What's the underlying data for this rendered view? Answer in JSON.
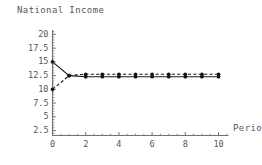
{
  "chart_data": {
    "type": "line",
    "title": "National Income",
    "xlabel": "Period",
    "ylabel": "",
    "xlim": [
      0,
      10.6
    ],
    "ylim": [
      1.6,
      20.8
    ],
    "grid": false,
    "legend": "none",
    "x": [
      0,
      1,
      2,
      3,
      4,
      5,
      6,
      7,
      8,
      9,
      10
    ],
    "series": [
      {
        "name": "series-dashed-upper",
        "style": "dashed",
        "marker": "filled-circle",
        "values": [
          10,
          12.5,
          12.75,
          12.75,
          12.75,
          12.75,
          12.75,
          12.75,
          12.75,
          12.75,
          12.75
        ]
      },
      {
        "name": "series-solid-lower",
        "style": "solid",
        "marker": "filled-circle",
        "values": [
          15,
          12.5,
          12.3,
          12.3,
          12.3,
          12.3,
          12.3,
          12.3,
          12.3,
          12.3,
          12.3
        ]
      }
    ],
    "ytick_labels": [
      "2.5",
      "5",
      "7.5",
      "10",
      "12.5",
      "15",
      "17.5",
      "20"
    ],
    "ytick_values": [
      2.5,
      5,
      7.5,
      10,
      12.5,
      15,
      17.5,
      20
    ],
    "xtick_labels": [
      "0",
      "2",
      "4",
      "6",
      "8",
      "10"
    ],
    "xtick_values": [
      0,
      2,
      4,
      6,
      8,
      10
    ],
    "colors": {
      "text": "#55565a",
      "axis": "#6f7176",
      "series_solid": "#1a1a1a",
      "series_dashed": "#1a1a1a"
    }
  }
}
